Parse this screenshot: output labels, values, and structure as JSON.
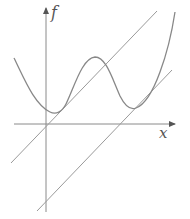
{
  "diagram": {
    "type": "function-graph-with-tangent-lines",
    "axes": {
      "x_label": "x",
      "y_label": "f",
      "origin_px": [
        46,
        124
      ]
    },
    "curve": {
      "name": "f",
      "description": "quartic-like curve with two local minima and one local maximum",
      "points_px": [
        [
          14,
          58
        ],
        [
          30,
          88
        ],
        [
          46,
          108
        ],
        [
          54,
          113
        ],
        [
          64,
          108
        ],
        [
          78,
          80
        ],
        [
          95,
          57
        ],
        [
          110,
          72
        ],
        [
          124,
          101
        ],
        [
          134,
          108
        ],
        [
          146,
          100
        ],
        [
          160,
          70
        ],
        [
          175,
          12
        ]
      ]
    },
    "lines": [
      {
        "name": "upper-tangent-line",
        "from_px": [
          11,
          163
        ],
        "to_px": [
          157,
          11
        ],
        "note": "passes through origin, tangent near left minimum"
      },
      {
        "name": "lower-tangent-line",
        "from_px": [
          37,
          211
        ],
        "to_px": [
          172,
          70
        ],
        "note": "parallel line tangent near right minimum"
      }
    ],
    "colors": {
      "curve": "#888888",
      "axis": "#8a8a8a",
      "line": "#9a9a9a",
      "label": "#555555"
    }
  }
}
